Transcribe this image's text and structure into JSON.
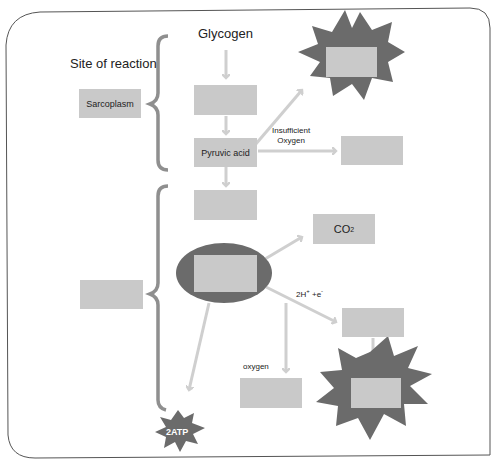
{
  "diagram": {
    "title_label": "Site of reaction",
    "start_label": "Glycogen",
    "site_1": {
      "label": "Sarcoplasm"
    },
    "site_2": {
      "label": ""
    },
    "pyruvic_acid": {
      "label": "Pyruvic acid"
    },
    "insufficient_oxygen_label_line1": "Insufficient",
    "insufficient_oxygen_label_line2": "Oxygen",
    "co2": {
      "label": "CO",
      "subscript": "2"
    },
    "h_electrons_label": "2H",
    "h_plus": "+",
    "electron_label": "+e",
    "electron_minus": "-",
    "oxygen_label": "oxygen",
    "atp_label": "2ATP",
    "blank_boxes": [
      "",
      "",
      "",
      "",
      "",
      "",
      "",
      "",
      ""
    ],
    "colors": {
      "box_fill": "#c9c9c9",
      "arrow": "#cfcfcf",
      "burst": "#6b6b6b",
      "ellipse": "#6b6b6b",
      "brace": "#8f8f8f",
      "frame": "#555555"
    }
  }
}
